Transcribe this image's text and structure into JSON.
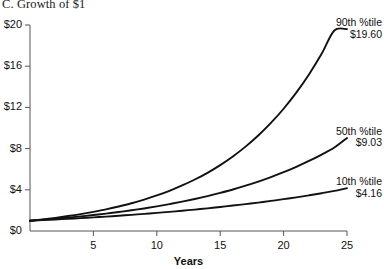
{
  "chart_data": {
    "type": "line",
    "title": "C. Growth of $1",
    "xlabel": "Years",
    "ylabel": "",
    "xlim": [
      0,
      25
    ],
    "ylim": [
      0,
      20
    ],
    "grid": false,
    "legend_position": "inline-right-annotations",
    "xticks": [
      "5",
      "10",
      "15",
      "20",
      "25"
    ],
    "xtick_values": [
      5,
      10,
      15,
      20,
      25
    ],
    "yticks": [
      "$0",
      "$4",
      "$8",
      "$12",
      "$16",
      "$20"
    ],
    "ytick_values": [
      0,
      4,
      8,
      12,
      16,
      20
    ],
    "x": [
      0,
      1,
      2,
      3,
      4,
      5,
      6,
      7,
      8,
      9,
      10,
      11,
      12,
      13,
      14,
      15,
      16,
      17,
      18,
      19,
      20,
      21,
      22,
      23,
      24,
      25
    ],
    "series": [
      {
        "name": "90th %tile",
        "end_label": "$19.60",
        "end_value": 19.6,
        "color": "#111111",
        "values": [
          1.0,
          1.13,
          1.28,
          1.45,
          1.64,
          1.86,
          2.1,
          2.38,
          2.69,
          3.05,
          3.45,
          3.9,
          4.42,
          5.0,
          5.65,
          6.4,
          7.24,
          8.19,
          9.27,
          10.49,
          11.87,
          13.43,
          15.2,
          17.2,
          19.47,
          19.6
        ]
      },
      {
        "name": "50th %tile",
        "end_label": "$9.03",
        "end_value": 9.03,
        "color": "#111111",
        "values": [
          1.0,
          1.09,
          1.19,
          1.3,
          1.42,
          1.55,
          1.69,
          1.84,
          2.01,
          2.19,
          2.39,
          2.61,
          2.85,
          3.11,
          3.39,
          3.7,
          4.03,
          4.4,
          4.8,
          5.24,
          5.71,
          6.23,
          6.8,
          7.42,
          8.1,
          9.03
        ]
      },
      {
        "name": "10th %tile",
        "end_label": "$4.16",
        "end_value": 4.16,
        "color": "#111111",
        "values": [
          1.0,
          1.06,
          1.12,
          1.18,
          1.25,
          1.32,
          1.4,
          1.48,
          1.57,
          1.66,
          1.76,
          1.86,
          1.97,
          2.08,
          2.2,
          2.33,
          2.47,
          2.61,
          2.76,
          2.92,
          3.09,
          3.27,
          3.46,
          3.67,
          3.89,
          4.16
        ]
      }
    ]
  },
  "axis": {
    "line_color": "#555555",
    "tick_color": "#555555"
  }
}
